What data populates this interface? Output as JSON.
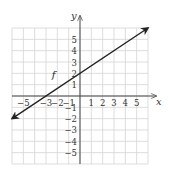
{
  "chart_data": {
    "type": "line",
    "title": "",
    "xlabel": "x",
    "ylabel": "y",
    "xlim": [
      -6,
      6
    ],
    "ylim": [
      -6,
      6
    ],
    "grid": true,
    "x_ticks": [
      -5,
      -3,
      -2,
      -1,
      1,
      2,
      3,
      4,
      5
    ],
    "y_ticks": [
      5,
      4,
      3,
      2,
      1,
      -1,
      -2,
      -3,
      -4,
      -5
    ],
    "x_tick_labels": [
      "−5",
      "−3",
      "−2",
      "−1",
      "1",
      "2",
      "3",
      "4",
      "5"
    ],
    "y_tick_labels": [
      "5",
      "4",
      "3",
      "2",
      "1",
      "−1",
      "−2",
      "−3",
      "−4",
      "−5"
    ],
    "series": [
      {
        "name": "f",
        "equation": "y = (2/3)x + 2",
        "x": [
          -6,
          -3,
          0,
          6
        ],
        "y": [
          -2,
          0,
          2,
          6
        ],
        "arrows": "both"
      }
    ],
    "annotations": [
      {
        "text": "f",
        "x": -2.5,
        "y": 1.6
      }
    ]
  },
  "layout": {
    "origin_px": [
      80,
      96
    ],
    "unit_px": 11.33,
    "axis_color": "#444444",
    "grid_color": "#d4d4d4",
    "line_color": "#222222"
  }
}
